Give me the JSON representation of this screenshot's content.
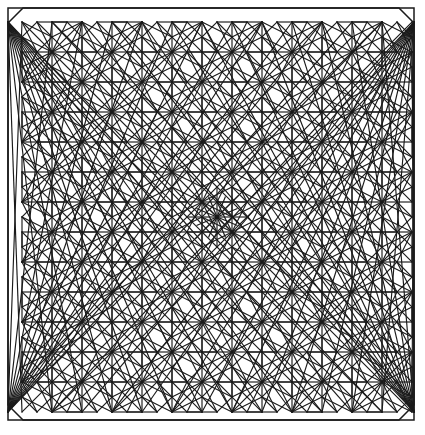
{
  "figure": {
    "background_color": "#ffffff",
    "line_color": "#1a1a1a",
    "canvas": {
      "width": 425,
      "height": 435
    }
  },
  "frame": {
    "name": "outer-border",
    "x": 8,
    "y": 8,
    "width": 406,
    "height": 412,
    "stroke_width": 1.5,
    "corner_chamfer": 15
  },
  "grid": {
    "module": 30,
    "origin_x": 22,
    "origin_y": 22,
    "columns": 13,
    "rows": 13,
    "cell_stroke_width": 1.15
  },
  "chart_data": {
    "type": "diagram",
    "tiling": "4.8.8 truncated square tiling",
    "module_size": 30,
    "grid_origin": [
      22,
      22
    ],
    "grid_columns": 13,
    "grid_rows": 13,
    "motifs": [
      {
        "name": "square-with-x",
        "parity": "odd-odd",
        "description": "Square cell outlined with both diagonals forming an X"
      },
      {
        "name": "octagon",
        "parity": "even-even",
        "description": "Regular octagon formed by chamfering square corners"
      },
      {
        "name": "star-rosette",
        "parity": "node",
        "description": "Eight-point star where diagonals converge at grid vertices"
      },
      {
        "name": "center-cross",
        "parity": "center",
        "description": "Central plus/cross motif with radiating spokes"
      }
    ],
    "center_node": [
      217,
      217
    ],
    "star_spokes": 16,
    "symmetry": "p4m (four-fold mirror)",
    "line_color": "#1a1a1a",
    "background_color": "#ffffff"
  }
}
